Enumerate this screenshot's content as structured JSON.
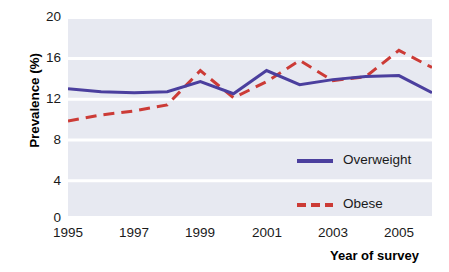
{
  "chart_data": {
    "type": "line",
    "title": "",
    "xlabel": "Year of survey",
    "ylabel": "Prevalence (%)",
    "x": [
      1995,
      1996,
      1997,
      1998,
      1999,
      2000,
      2001,
      2002,
      2003,
      2004,
      2005,
      2006
    ],
    "xlim": [
      1995,
      2006
    ],
    "ylim": [
      0,
      20
    ],
    "yticks": [
      0,
      4,
      8,
      12,
      16,
      20
    ],
    "ytick_labels": [
      "0",
      "4",
      "8",
      "12",
      "16",
      "20"
    ],
    "xticks": [
      1995,
      1997,
      1999,
      2001,
      2003,
      2005
    ],
    "xtick_labels": [
      "1995",
      "1997",
      "1999",
      "2001",
      "2003",
      "2005"
    ],
    "grid": "horizontal",
    "legend_position": "inside-lower-right",
    "series": [
      {
        "name": "Overweight",
        "style": "solid",
        "color": "#4b3f9e",
        "values": [
          12.8,
          12.5,
          12.4,
          12.5,
          13.5,
          12.3,
          14.6,
          13.2,
          13.7,
          14.0,
          14.1,
          12.4
        ]
      },
      {
        "name": "Obese",
        "style": "dashed",
        "color": "#cc3b36",
        "values": [
          9.6,
          10.2,
          10.6,
          11.2,
          14.6,
          11.9,
          13.5,
          15.6,
          13.6,
          14.0,
          16.6,
          14.9
        ]
      }
    ],
    "plot_background": "#e7e9f1",
    "gridline_color": "#ffffff"
  },
  "axes": {
    "y_title": "Prevalence (%)",
    "x_title": "Year of survey",
    "y_tick_0": "0",
    "y_tick_1": "4",
    "y_tick_2": "8",
    "y_tick_3": "12",
    "y_tick_4": "16",
    "y_tick_5": "20",
    "x_tick_0": "1995",
    "x_tick_1": "1997",
    "x_tick_2": "1999",
    "x_tick_3": "2001",
    "x_tick_4": "2003",
    "x_tick_5": "2005"
  },
  "legend": {
    "items": [
      {
        "label": "Overweight",
        "color": "#4b3f9e",
        "style": "solid"
      },
      {
        "label": "Obese",
        "color": "#cc3b36",
        "style": "dashed"
      }
    ]
  }
}
